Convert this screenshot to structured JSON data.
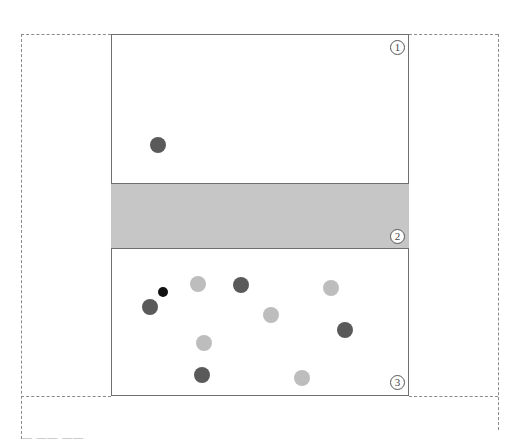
{
  "diagram": {
    "regions": [
      {
        "id": "region-1",
        "label": "1",
        "type": "empty"
      },
      {
        "id": "region-2",
        "label": "2",
        "type": "shaded-band"
      },
      {
        "id": "region-3",
        "label": "3",
        "type": "empty"
      }
    ],
    "colors": {
      "dark_dot": "#5a5a5a",
      "light_dot": "#bdbdbd",
      "black_dot": "#111111",
      "band": "#c6c6c6"
    },
    "dots": [
      {
        "x": 158,
        "y": 145,
        "r": 8,
        "shade": "dark"
      },
      {
        "x": 163,
        "y": 292,
        "r": 5,
        "shade": "black"
      },
      {
        "x": 150,
        "y": 307,
        "r": 8,
        "shade": "dark"
      },
      {
        "x": 198,
        "y": 284,
        "r": 8,
        "shade": "light"
      },
      {
        "x": 241,
        "y": 285,
        "r": 8,
        "shade": "dark"
      },
      {
        "x": 331,
        "y": 288,
        "r": 8,
        "shade": "light"
      },
      {
        "x": 271,
        "y": 315,
        "r": 8,
        "shade": "light"
      },
      {
        "x": 345,
        "y": 330,
        "r": 8,
        "shade": "dark"
      },
      {
        "x": 204,
        "y": 343,
        "r": 8,
        "shade": "light"
      },
      {
        "x": 202,
        "y": 375,
        "r": 8,
        "shade": "dark"
      },
      {
        "x": 302,
        "y": 378,
        "r": 8,
        "shade": "light"
      }
    ],
    "caption": "— —— ——"
  }
}
